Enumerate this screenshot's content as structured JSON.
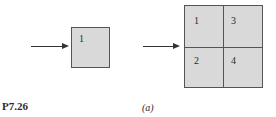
{
  "problem_label": "P7.26",
  "caption": "(a)",
  "left_diagram": {
    "cells": [
      "1"
    ]
  },
  "right_diagram": {
    "cells": [
      "1",
      "3",
      "2",
      "4"
    ]
  },
  "colors": {
    "fill": "#d9d9d9",
    "stroke": "#555555"
  }
}
